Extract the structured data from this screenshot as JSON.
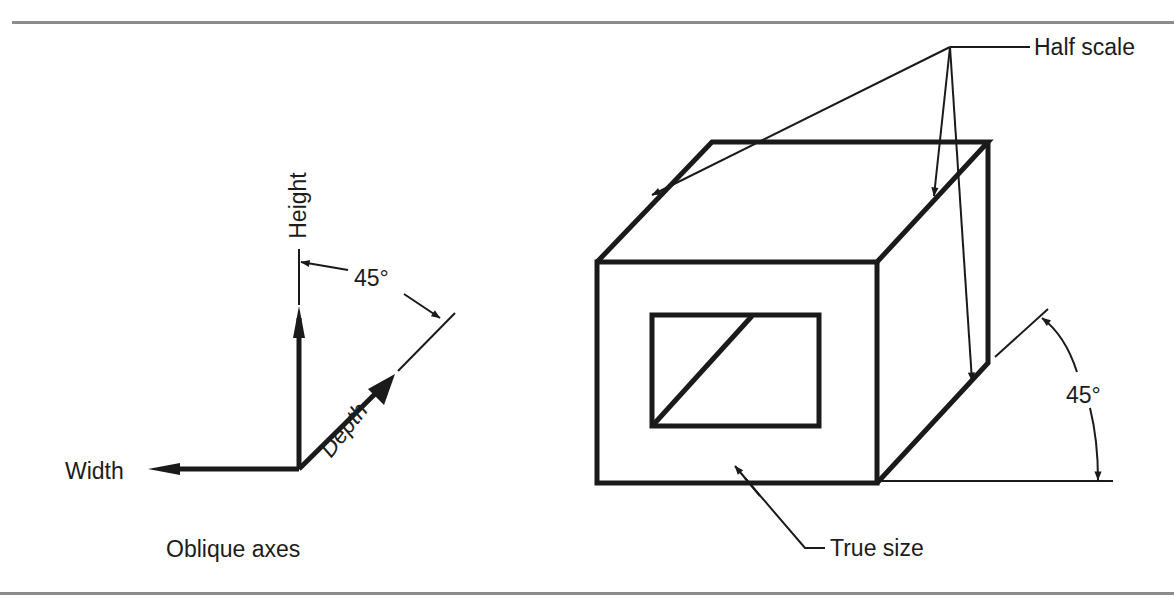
{
  "figure": {
    "left_panel": {
      "caption": "Oblique axes",
      "axes": {
        "height_label": "Height",
        "width_label": "Width",
        "depth_label": "Depth",
        "angle_label": "45°"
      }
    },
    "right_panel": {
      "callouts": {
        "half_scale": "Half scale",
        "true_size": "True size"
      },
      "angle_label": "45°"
    }
  },
  "colors": {
    "line": "#1a1a1a",
    "rule": "#8d8d8d",
    "background": "#ffffff"
  }
}
